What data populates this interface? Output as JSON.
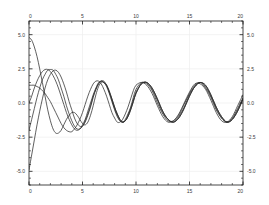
{
  "chart_data": {
    "type": "line",
    "title": "",
    "subtitle": "",
    "xlabel": "",
    "ylabel": "",
    "xlim": [
      0,
      20
    ],
    "ylim": [
      -6.0,
      6.0
    ],
    "grid": true,
    "legend": false,
    "legend_position": "none",
    "x_ticks": [
      0,
      5,
      10,
      15,
      20
    ],
    "x_tick_labels": [
      "0",
      "5",
      "10",
      "15",
      "20"
    ],
    "x_minor_tick_step": 1,
    "y_ticks": [
      5.0,
      2.5,
      0.0,
      -2.5,
      -5.0
    ],
    "y_tick_labels": [
      "5.0",
      "2.5",
      "0.0",
      "-2.5",
      "-5.0"
    ],
    "y_minor_tick_step": 0.5,
    "axes": {
      "top_axis_labeled": true,
      "bottom_axis_labeled": true,
      "left_axis_labeled": true,
      "right_axis_labeled": true
    },
    "line_color": "#2b2b2b",
    "grid_color": "#eeeeee",
    "frame_color": "#1a1a1a",
    "background_color": "#ffffff",
    "steady_state": {
      "amplitude": 1.5,
      "period": 6.3,
      "mean": 0.1
    },
    "series": [
      {
        "name": "trajectory-1",
        "initial_value": 4.8,
        "x": [
          0,
          0.25,
          0.5,
          0.75,
          1,
          1.25,
          1.5,
          1.75,
          2,
          2.25,
          2.5,
          2.75,
          3,
          3.25,
          3.5,
          3.75,
          4,
          4.25,
          4.5,
          4.75,
          5,
          5.25,
          5.5,
          5.75,
          6,
          6.25,
          6.5,
          6.75,
          7,
          7.25,
          7.5,
          7.75,
          8,
          8.25,
          8.5,
          8.75,
          9,
          9.25,
          9.5,
          9.75,
          10,
          10.5,
          11,
          11.5,
          12,
          12.5,
          13,
          13.5,
          14,
          14.5,
          15,
          15.5,
          16,
          16.5,
          17,
          17.5,
          18,
          18.5,
          19,
          19.5,
          20
        ],
        "y": [
          4.8,
          4.6,
          4.1,
          3.4,
          2.5,
          1.5,
          0.5,
          -0.5,
          -1.3,
          -1.9,
          -2.2,
          -2.2,
          -2.0,
          -1.6,
          -1.2,
          -0.9,
          -0.7,
          -0.7,
          -0.9,
          -1.2,
          -1.5,
          -1.6,
          -1.4,
          -0.9,
          -0.2,
          0.6,
          1.2,
          1.5,
          1.5,
          1.3,
          0.8,
          0.2,
          -0.4,
          -0.9,
          -1.3,
          -1.4,
          -1.3,
          -1.0,
          -0.5,
          0.1,
          0.7,
          1.4,
          1.5,
          1.1,
          0.3,
          -0.6,
          -1.2,
          -1.4,
          -1.1,
          -0.4,
          0.5,
          1.2,
          1.5,
          1.3,
          0.6,
          -0.3,
          -1.0,
          -1.4,
          -1.2,
          -0.6,
          0.3
        ]
      },
      {
        "name": "trajectory-2",
        "initial_value": 1.3,
        "x": [
          0,
          0.25,
          0.5,
          0.75,
          1,
          1.25,
          1.5,
          1.75,
          2,
          2.25,
          2.5,
          2.75,
          3,
          3.25,
          3.5,
          3.75,
          4,
          4.25,
          4.5,
          4.75,
          5,
          5.25,
          5.5,
          5.75,
          6,
          6.25,
          6.5,
          6.75,
          7,
          7.25,
          7.5,
          7.75,
          8,
          8.25,
          8.5,
          8.75,
          9,
          9.25,
          9.5,
          9.75,
          10,
          10.5,
          11,
          11.5,
          12,
          12.5,
          13,
          13.5,
          14,
          14.5,
          15,
          15.5,
          16,
          16.5,
          17,
          17.5,
          18,
          18.5,
          19,
          19.5,
          20
        ],
        "y": [
          1.3,
          1.3,
          1.3,
          1.2,
          1.1,
          0.9,
          0.7,
          0.4,
          0.1,
          -0.3,
          -0.7,
          -1.1,
          -1.5,
          -1.8,
          -2.0,
          -2.1,
          -2.1,
          -1.9,
          -1.6,
          -1.2,
          -0.7,
          -0.1,
          0.5,
          1.0,
          1.4,
          1.6,
          1.6,
          1.4,
          1.0,
          0.5,
          -0.1,
          -0.7,
          -1.1,
          -1.4,
          -1.4,
          -1.2,
          -0.8,
          -0.3,
          0.3,
          0.9,
          1.3,
          1.5,
          1.3,
          0.7,
          -0.2,
          -1.0,
          -1.4,
          -1.3,
          -0.8,
          0.0,
          0.8,
          1.4,
          1.4,
          1.0,
          0.2,
          -0.7,
          -1.3,
          -1.4,
          -1.0,
          -0.2,
          0.6
        ]
      },
      {
        "name": "trajectory-3",
        "initial_value": 0.0,
        "x": [
          0,
          0.25,
          0.5,
          0.75,
          1,
          1.25,
          1.5,
          1.75,
          2,
          2.25,
          2.5,
          2.75,
          3,
          3.25,
          3.5,
          3.75,
          4,
          4.25,
          4.5,
          4.75,
          5,
          5.25,
          5.5,
          5.75,
          6,
          6.25,
          6.5,
          6.75,
          7,
          7.25,
          7.5,
          7.75,
          8,
          8.25,
          8.5,
          8.75,
          9,
          9.25,
          9.5,
          9.75,
          10,
          10.5,
          11,
          11.5,
          12,
          12.5,
          13,
          13.5,
          14,
          14.5,
          15,
          15.5,
          16,
          16.5,
          17,
          17.5,
          18,
          18.5,
          19,
          19.5,
          20
        ],
        "y": [
          0.0,
          0.5,
          1.1,
          1.6,
          2.0,
          2.3,
          2.45,
          2.45,
          2.3,
          2.0,
          1.6,
          1.1,
          0.5,
          -0.1,
          -0.7,
          -1.2,
          -1.6,
          -1.9,
          -2.0,
          -1.9,
          -1.6,
          -1.2,
          -0.6,
          0.0,
          0.6,
          1.1,
          1.5,
          1.6,
          1.5,
          1.2,
          0.7,
          0.1,
          -0.5,
          -1.0,
          -1.3,
          -1.4,
          -1.2,
          -0.8,
          -0.3,
          0.4,
          1.0,
          1.5,
          1.4,
          0.9,
          0.0,
          -0.8,
          -1.3,
          -1.3,
          -0.9,
          -0.1,
          0.7,
          1.3,
          1.5,
          1.1,
          0.4,
          -0.5,
          -1.1,
          -1.4,
          -1.1,
          -0.4,
          0.4
        ]
      },
      {
        "name": "trajectory-4",
        "initial_value": -2.0,
        "x": [
          0,
          0.25,
          0.5,
          0.75,
          1,
          1.25,
          1.5,
          1.75,
          2,
          2.25,
          2.5,
          2.75,
          3,
          3.25,
          3.5,
          3.75,
          4,
          4.25,
          4.5,
          4.75,
          5,
          5.25,
          5.5,
          5.75,
          6,
          6.25,
          6.5,
          6.75,
          7,
          7.25,
          7.5,
          7.75,
          8,
          8.25,
          8.5,
          8.75,
          9,
          9.25,
          9.5,
          9.75,
          10,
          10.5,
          11,
          11.5,
          12,
          12.5,
          13,
          13.5,
          14,
          14.5,
          15,
          15.5,
          16,
          16.5,
          17,
          17.5,
          18,
          18.5,
          19,
          19.5,
          20
        ],
        "y": [
          -2.0,
          -1.2,
          -0.4,
          0.4,
          1.1,
          1.7,
          2.1,
          2.4,
          2.45,
          2.4,
          2.1,
          1.7,
          1.1,
          0.5,
          -0.2,
          -0.8,
          -1.3,
          -1.7,
          -1.9,
          -1.9,
          -1.7,
          -1.3,
          -0.8,
          -0.2,
          0.5,
          1.0,
          1.4,
          1.6,
          1.5,
          1.3,
          0.8,
          0.3,
          -0.3,
          -0.8,
          -1.2,
          -1.4,
          -1.3,
          -0.9,
          -0.4,
          0.2,
          0.8,
          1.4,
          1.5,
          1.0,
          0.2,
          -0.7,
          -1.2,
          -1.4,
          -1.0,
          -0.3,
          0.6,
          1.2,
          1.5,
          1.2,
          0.5,
          -0.4,
          -1.1,
          -1.4,
          -1.2,
          -0.5,
          0.3
        ]
      },
      {
        "name": "trajectory-5",
        "initial_value": -4.9,
        "x": [
          0,
          0.25,
          0.5,
          0.75,
          1,
          1.25,
          1.5,
          1.75,
          2,
          2.25,
          2.5,
          2.75,
          3,
          3.25,
          3.5,
          3.75,
          4,
          4.25,
          4.5,
          4.75,
          5,
          5.25,
          5.5,
          5.75,
          6,
          6.25,
          6.5,
          6.75,
          7,
          7.25,
          7.5,
          7.75,
          8,
          8.25,
          8.5,
          8.75,
          9,
          9.25,
          9.5,
          9.75,
          10,
          10.5,
          11,
          11.5,
          12,
          12.5,
          13,
          13.5,
          14,
          14.5,
          15,
          15.5,
          16,
          16.5,
          17,
          17.5,
          18,
          18.5,
          19,
          19.5,
          20
        ],
        "y": [
          -4.9,
          -3.8,
          -2.7,
          -1.6,
          -0.6,
          0.3,
          1.1,
          1.7,
          2.1,
          2.35,
          2.4,
          2.25,
          1.9,
          1.4,
          0.8,
          0.1,
          -0.5,
          -1.1,
          -1.5,
          -1.7,
          -1.7,
          -1.4,
          -0.9,
          -0.3,
          0.4,
          1.0,
          1.4,
          1.6,
          1.6,
          1.3,
          0.9,
          0.3,
          -0.3,
          -0.8,
          -1.2,
          -1.4,
          -1.3,
          -1.0,
          -0.5,
          0.1,
          0.7,
          1.4,
          1.5,
          1.1,
          0.3,
          -0.6,
          -1.2,
          -1.4,
          -1.1,
          -0.4,
          0.5,
          1.2,
          1.5,
          1.3,
          0.6,
          -0.3,
          -1.0,
          -1.4,
          -1.2,
          -0.6,
          0.3
        ]
      }
    ]
  }
}
